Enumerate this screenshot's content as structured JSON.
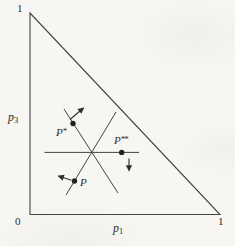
{
  "figure": {
    "colors": {
      "paper": "#f7f6f3",
      "ink": "#45443f",
      "dot": "#23221e",
      "text": "#2e2d29"
    },
    "axes": {
      "top_tick": "1",
      "origin_tick": "0",
      "right_tick": "1",
      "y_label": {
        "base": "p",
        "sub": "3"
      },
      "x_label": {
        "base": "p",
        "sub": "1"
      }
    },
    "points": {
      "p_star": {
        "base": "P",
        "sup": "*"
      },
      "p_double_star": {
        "base": "P",
        "sup": "**"
      },
      "p": {
        "base": "P",
        "sup": ""
      }
    },
    "annotations": {
      "arrows": [
        {
          "at": "P*",
          "direction": "northeast"
        },
        {
          "at": "P",
          "direction": "west"
        },
        {
          "at": "P**",
          "direction": "south"
        }
      ]
    }
  }
}
